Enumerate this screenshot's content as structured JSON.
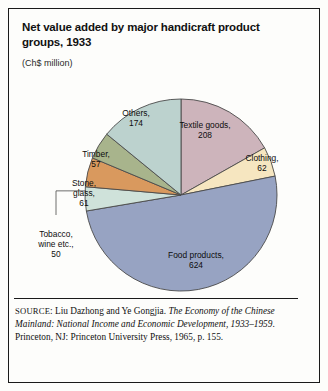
{
  "figure": {
    "title": "Net value added by major handicraft product groups, 1933",
    "units": "(Ch$ million)",
    "source_prefix": "SOURCE",
    "source_authors": ": Liu Dazhong and Ye Gongjia. ",
    "source_work": "The Economy of the Chinese Mainland: National Income and Economic Development, 1933–1959",
    "source_publication": ". Princeton, NJ: Princeton University Press, 1965, p. 155."
  },
  "chart_data": {
    "type": "pie",
    "title": "Net value added by major handicraft product groups, 1933",
    "units": "Ch$ million",
    "total": 1236,
    "start_angle": 0,
    "direction": "clockwise",
    "center": {
      "x": 181,
      "y": 195
    },
    "radius": 96,
    "legend": "none",
    "labels_position": "inside-slices-with-leaders",
    "slices": [
      {
        "label": "Textile goods",
        "value": 208,
        "color": "#cdb4bb",
        "label_x": 205,
        "label_y": 128,
        "label_anchor": "middle",
        "leader": false
      },
      {
        "label": "Clothing",
        "value": 62,
        "color": "#f6e6c0",
        "label_x": 262,
        "label_y": 161,
        "label_anchor": "middle",
        "leader": false
      },
      {
        "label": "Food products",
        "value": 624,
        "color": "#97a3c2",
        "label_x": 196,
        "label_y": 258,
        "label_anchor": "middle",
        "leader": false
      },
      {
        "label": "Tobacco, wine etc.",
        "value": 50,
        "color": "#cfe2da",
        "label_x": 56,
        "label_y": 237,
        "label_anchor": "middle",
        "leader": true
      },
      {
        "label": "Stone, glass",
        "value": 61,
        "color": "#d9995e",
        "label_x": 84,
        "label_y": 186,
        "label_anchor": "middle",
        "leader": false
      },
      {
        "label": "Timber",
        "value": 57,
        "color": "#a8b48c",
        "label_x": 96,
        "label_y": 157,
        "label_anchor": "middle",
        "leader": false
      },
      {
        "label": "Others",
        "value": 174,
        "color": "#bcd2ce",
        "label_x": 136,
        "label_y": 116,
        "label_anchor": "middle",
        "leader": false
      }
    ]
  }
}
